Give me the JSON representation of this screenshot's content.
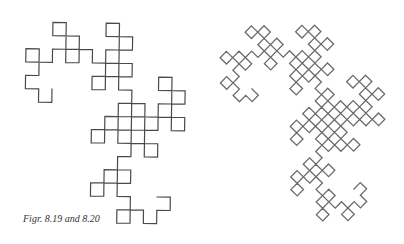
{
  "caption": "Figr. 8.19 and 8.20",
  "figures": [
    {
      "id": "fig-8-19",
      "description": "Dragon curve, axis-aligned",
      "order": 7,
      "endpoints": [
        [
          52,
          89
        ],
        [
          157,
          197
        ]
      ],
      "bbox": [
        26,
        21,
        183,
        223
      ],
      "stroke": "#4a4a4a",
      "stroke_width": 1.2
    },
    {
      "id": "fig-8-20",
      "description": "Dragon curve, next order, rotated 45 degrees",
      "order": 8,
      "endpoints": [
        [
          252,
          89
        ],
        [
          354,
          189
        ]
      ],
      "bbox": [
        213,
        15,
        383,
        226
      ],
      "stroke": "#6a6a6a",
      "stroke_width": 1.3
    }
  ]
}
